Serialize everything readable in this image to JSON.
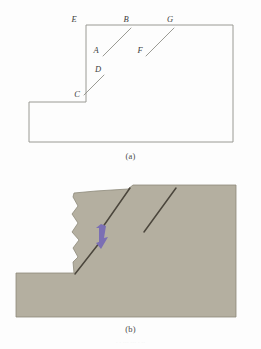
{
  "figure": {
    "panels": [
      {
        "id": "a",
        "caption": "(a)",
        "type": "line-diagram",
        "description": "Outline of a stepped excavation / slope cross-section with labelled tension cracks",
        "line_color": "#9a9a94",
        "label_color": "#3c3c3c",
        "labels": [
          {
            "key": "E",
            "text": "E",
            "x": 74,
            "y": 22
          },
          {
            "key": "B",
            "text": "B",
            "x": 126,
            "y": 22
          },
          {
            "key": "G",
            "text": "G",
            "x": 170,
            "y": 22
          },
          {
            "key": "A",
            "text": "A",
            "x": 96,
            "y": 50
          },
          {
            "key": "F",
            "text": "F",
            "x": 140,
            "y": 50
          },
          {
            "key": "D",
            "text": "D",
            "x": 97,
            "y": 72
          },
          {
            "key": "C",
            "text": "C",
            "x": 75,
            "y": 94
          }
        ],
        "outline_points": "86,25 233,25 233,142 29,142 29,102 86,102 86,25",
        "cracks": [
          {
            "name": "crack-AB",
            "x1": 103,
            "y1": 56,
            "x2": 131,
            "y2": 28
          },
          {
            "name": "crack-FG",
            "x1": 146,
            "y1": 56,
            "x2": 174,
            "y2": 28
          },
          {
            "name": "crack-CD",
            "x1": 84,
            "y1": 95,
            "x2": 104,
            "y2": 75
          }
        ]
      },
      {
        "id": "b",
        "caption": "(b)",
        "type": "shaded-diagram",
        "description": "Same cross-section shown as a shaded soil mass with a developed failure surface and a purple displacement arrow",
        "soil_fill": "#b4afa0",
        "soil_stroke": "#8d897a",
        "fissure_color": "#4b463c",
        "arrow_color": "#7b6fb4",
        "soil_outline": "73,197 74,193 96,191 112,190 128,189 133,185 236,185 236,233 236,317 16,317 16,273 74,273 73,262 78,257 73,248 79,240 72,232 78,223 72,214 78,206",
        "fissures": [
          {
            "name": "fissure-main-upper",
            "path": "M 130,188 L 100,231"
          },
          {
            "name": "fissure-main-lower",
            "path": "M 100,242 L 75,274"
          },
          {
            "name": "fissure-secondary",
            "path": "M 176,188 L 144,232"
          }
        ],
        "arrow": {
          "name": "displacement-arrow",
          "points": "101,224 106,226 104,238 108,237 101,249 96,243 99,242 99,228 96,228"
        }
      }
    ]
  },
  "bottom_edge_artifact": "·  ·   ···   ···  ·  ··"
}
